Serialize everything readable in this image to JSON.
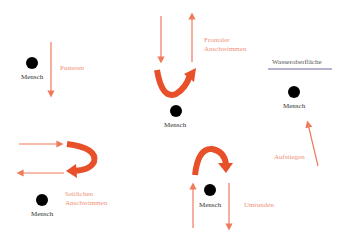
{
  "diagram": {
    "colors": {
      "arrow": "#f07a5c",
      "curve": "#e8502a",
      "person": "#000000",
      "surface_line": "#6a6aa0"
    },
    "groups": [
      {
        "id": "pustern",
        "label": "Pusteren",
        "person": "Mensch"
      },
      {
        "id": "frontal",
        "label": "Frontaler\nAnschwimmen",
        "person": "Mensch"
      },
      {
        "id": "aufsteigen",
        "label": "Aufstiegen",
        "person": "Mensch",
        "surface": "Wasseroberfläche"
      },
      {
        "id": "seitlich",
        "label": "Seitlichen\nAnschwimmen",
        "person": "Mensch"
      },
      {
        "id": "umrunden",
        "label": "Umrunden",
        "person": "Mensch"
      }
    ]
  }
}
